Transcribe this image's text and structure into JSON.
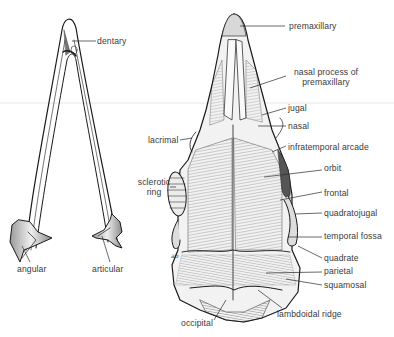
{
  "figure": {
    "left_drawing": "lower jaw (mandible), dorsal view",
    "right_drawing": "skull, dorsal view"
  },
  "labels": {
    "dentary": "dentary",
    "lacrimal": "lacrimal",
    "sclerotic_ring_1": "sclerotic",
    "sclerotic_ring_2": "ring",
    "angular": "angular",
    "articular": "articular",
    "occipital": "occipital",
    "premaxillary": "premaxillary",
    "nasal_process_1": "nasal process of",
    "nasal_process_2": "premaxillary",
    "jugal": "jugal",
    "nasal": "nasal",
    "infratemporal_arcade": "infratemporal arcade",
    "orbit": "orbit",
    "frontal": "frontal",
    "quadratojugal": "quadratojugal",
    "temporal_fossa": "temporal fossa",
    "quadrate": "quadrate",
    "parietal": "parietal",
    "squamosal": "squamosal",
    "lambdoidal_ridge": "lambdoidal ridge",
    "signature": "ab"
  },
  "colors": {
    "ink": "#1a1a1a",
    "label": "#3a3a3a",
    "bone_light": "#e9e9e9",
    "bone_mid": "#bdbdbd",
    "bone_dark": "#6a6a6a",
    "background": "#ffffff"
  }
}
